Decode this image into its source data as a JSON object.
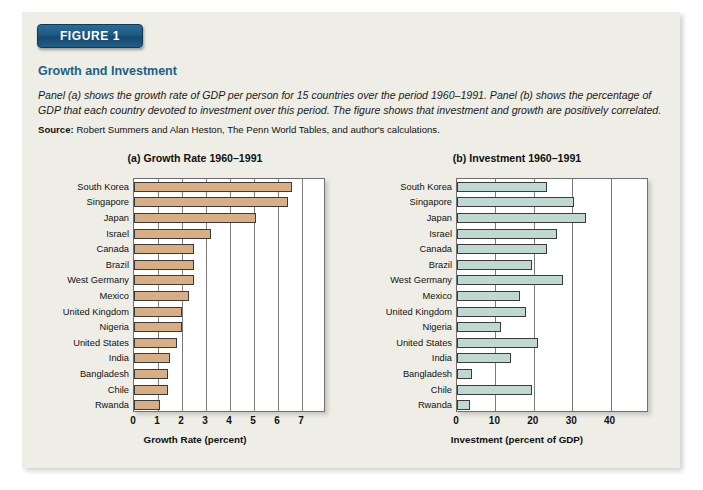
{
  "figure": {
    "banner_label": "FIGURE 1",
    "title": "Growth and Investment",
    "description": "Panel (a) shows the growth rate of GDP per person for 15 countries over the period 1960–1991. Panel (b) shows the percentage of GDP that each country devoted to investment over this period. The figure shows that investment and growth are positively correlated.",
    "source_label": "Source:",
    "source_text": " Robert Summers and Alan Heston, The Penn World Tables, and author's calculations.",
    "colors": {
      "card_background": "#eeeee6",
      "banner": "#1d5a84",
      "title": "#1d5f86",
      "bar_growth": "#d9ae86",
      "bar_investment": "#bfd8d2",
      "axis": "#6f6f6f"
    }
  },
  "chart_data": [
    {
      "type": "bar",
      "orientation": "horizontal",
      "panel": "a",
      "title": "(a) Growth Rate 1960–1991",
      "xlabel": "Growth Rate (percent)",
      "ylabel": "",
      "xlim": [
        0,
        8
      ],
      "xticks": [
        0,
        1,
        2,
        3,
        4,
        5,
        6,
        7
      ],
      "grid": true,
      "legend": "none",
      "categories": [
        "South Korea",
        "Singapore",
        "Japan",
        "Israel",
        "Canada",
        "Brazil",
        "West Germany",
        "Mexico",
        "United Kingdom",
        "Nigeria",
        "United States",
        "India",
        "Bangladesh",
        "Chile",
        "Rwanda"
      ],
      "values": [
        6.6,
        6.4,
        5.1,
        3.2,
        2.5,
        2.5,
        2.5,
        2.3,
        2.0,
        2.0,
        1.8,
        1.5,
        1.4,
        1.4,
        1.1
      ],
      "series": [
        {
          "name": "Growth Rate (percent)",
          "values": [
            6.6,
            6.4,
            5.1,
            3.2,
            2.5,
            2.5,
            2.5,
            2.3,
            2.0,
            2.0,
            1.8,
            1.5,
            1.4,
            1.4,
            1.1
          ]
        }
      ]
    },
    {
      "type": "bar",
      "orientation": "horizontal",
      "panel": "b",
      "title": "(b) Investment 1960–1991",
      "xlabel": "Investment (percent of GDP)",
      "ylabel": "",
      "xlim": [
        0,
        50
      ],
      "xticks": [
        0,
        10,
        20,
        30,
        40
      ],
      "grid": true,
      "legend": "none",
      "categories": [
        "South Korea",
        "Singapore",
        "Japan",
        "Israel",
        "Canada",
        "Brazil",
        "West Germany",
        "Mexico",
        "United Kingdom",
        "Nigeria",
        "United States",
        "India",
        "Bangladesh",
        "Chile",
        "Rwanda"
      ],
      "values": [
        23.5,
        30.5,
        33.5,
        26.0,
        23.5,
        19.5,
        27.5,
        16.5,
        18.0,
        11.5,
        21.0,
        14.0,
        4.0,
        19.5,
        3.5
      ],
      "series": [
        {
          "name": "Investment (percent of GDP)",
          "values": [
            23.5,
            30.5,
            33.5,
            26.0,
            23.5,
            19.5,
            27.5,
            16.5,
            18.0,
            11.5,
            21.0,
            14.0,
            4.0,
            19.5,
            3.5
          ]
        }
      ]
    }
  ]
}
